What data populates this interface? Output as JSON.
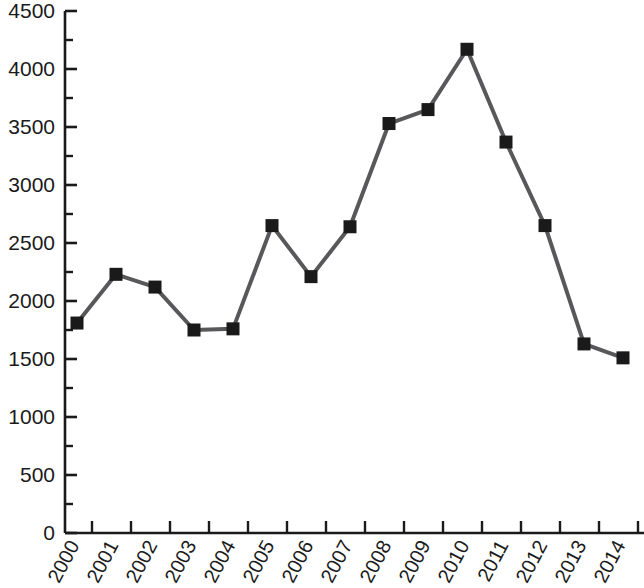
{
  "chart_data": {
    "type": "line",
    "title": "",
    "subtitle": "",
    "xlabel": "",
    "ylabel": "",
    "categories": [
      "2000",
      "2001",
      "2002",
      "2003",
      "2004",
      "2005",
      "2006",
      "2007",
      "2008",
      "2009",
      "2010",
      "2011",
      "2012",
      "2013",
      "2014"
    ],
    "values": [
      1810,
      2230,
      2120,
      1750,
      1760,
      2650,
      2210,
      2640,
      3530,
      3650,
      4170,
      3370,
      2650,
      1630,
      1510
    ],
    "series": [
      {
        "name": "",
        "values": [
          1810,
          2230,
          2120,
          1750,
          1760,
          2650,
          2210,
          2640,
          3530,
          3650,
          4170,
          3370,
          2650,
          1630,
          1510
        ]
      }
    ],
    "ylim": [
      0,
      4500
    ],
    "y_major_ticks": [
      0,
      500,
      1000,
      1500,
      2000,
      2500,
      3000,
      3500,
      4000,
      4500
    ],
    "y_minor_ticks": [
      250,
      750,
      1250,
      1750,
      2250,
      2750,
      3250,
      3750,
      4250
    ],
    "y_tick_labels": [
      "0",
      "500",
      "1000",
      "1500",
      "2000",
      "2500",
      "3000",
      "3500",
      "4000",
      "4500"
    ],
    "grid": false,
    "legend": false,
    "legend_position": "none",
    "marker": "square",
    "line_color": "#58585a",
    "marker_color": "#1a1a1a",
    "axis_color": "#1a1a1a",
    "xtick_rotation": -62
  }
}
